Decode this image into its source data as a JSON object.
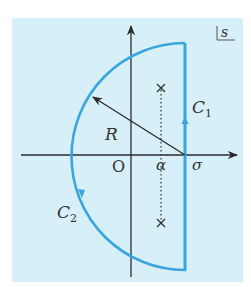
{
  "diagram": {
    "plane_label": "s",
    "colors": {
      "panel": "#d6eff9",
      "contour": "#3aa6df",
      "axis": "#2b2b2b",
      "text": "#333333"
    },
    "axes": {
      "horizontal_label": "σ",
      "origin_label": "O"
    },
    "labels": {
      "alpha": "α",
      "radius": "R",
      "c1_main": "C",
      "c1_sub": "1",
      "c2_main": "C",
      "c2_sub": "2"
    },
    "poles": [
      {
        "symbol": "×",
        "position": "upper"
      },
      {
        "symbol": "×",
        "position": "lower"
      }
    ]
  }
}
